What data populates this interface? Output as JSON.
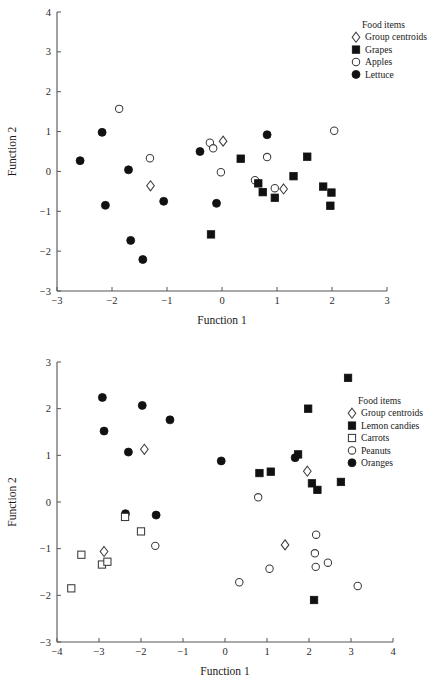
{
  "chart_data": [
    {
      "id": "top",
      "type": "scatter",
      "title": "",
      "xlabel": "Function 1",
      "ylabel": "Function 2",
      "xlim": [
        -3,
        3
      ],
      "ylim": [
        -3,
        4
      ],
      "xticks": [
        -3,
        -2,
        -1,
        0,
        1,
        2,
        3
      ],
      "xticklabels": [
        "−3",
        "−2",
        "−1",
        "0",
        "1",
        "2",
        "3"
      ],
      "yticks": [
        -3,
        -2,
        -1,
        0,
        1,
        2,
        3,
        4
      ],
      "yticklabels": [
        "−3",
        "−2",
        "−1",
        "0",
        "1",
        "2",
        "3",
        "4"
      ],
      "grid": false,
      "legend": {
        "title": "Food items",
        "position": "top-right",
        "entries": [
          {
            "label": "Group centroids",
            "marker": "diamond-open"
          },
          {
            "label": "Grapes",
            "marker": "square-filled"
          },
          {
            "label": "Apples",
            "marker": "circle-open"
          },
          {
            "label": "Lettuce",
            "marker": "circle-filled"
          }
        ]
      },
      "series": [
        {
          "name": "Lettuce",
          "marker": "circle-filled",
          "points": [
            [
              -2.58,
              0.27
            ],
            [
              -2.18,
              0.98
            ],
            [
              -2.12,
              -0.85
            ],
            [
              -1.7,
              0.04
            ],
            [
              -1.66,
              -1.73
            ],
            [
              -1.44,
              -2.21
            ],
            [
              -1.06,
              -0.75
            ],
            [
              -0.4,
              0.5
            ],
            [
              -0.1,
              -0.8
            ],
            [
              0.82,
              0.92
            ]
          ]
        },
        {
          "name": "Apples",
          "marker": "circle-open",
          "points": [
            [
              -1.87,
              1.57
            ],
            [
              -1.31,
              0.33
            ],
            [
              -0.22,
              0.72
            ],
            [
              -0.16,
              0.58
            ],
            [
              -0.02,
              -0.02
            ],
            [
              0.6,
              -0.22
            ],
            [
              0.82,
              0.36
            ],
            [
              0.96,
              -0.42
            ],
            [
              2.04,
              1.02
            ]
          ]
        },
        {
          "name": "Grapes",
          "marker": "square-filled",
          "points": [
            [
              -0.2,
              -1.58
            ],
            [
              0.34,
              0.32
            ],
            [
              0.66,
              -0.3
            ],
            [
              0.74,
              -0.52
            ],
            [
              0.96,
              -0.66
            ],
            [
              1.3,
              -0.12
            ],
            [
              1.55,
              0.37
            ],
            [
              1.84,
              -0.38
            ],
            [
              1.99,
              -0.53
            ],
            [
              1.97,
              -0.86
            ]
          ]
        },
        {
          "name": "Group centroids",
          "marker": "diamond-open",
          "points": [
            [
              -1.3,
              -0.36
            ],
            [
              0.02,
              0.76
            ],
            [
              1.12,
              -0.44
            ]
          ]
        }
      ]
    },
    {
      "id": "bottom",
      "type": "scatter",
      "title": "",
      "xlabel": "Function 1",
      "ylabel": "Function 2",
      "xlim": [
        -4,
        4
      ],
      "ylim": [
        -3,
        3
      ],
      "xticks": [
        -4,
        -3,
        -2,
        -1,
        0,
        1,
        2,
        3,
        4
      ],
      "xticklabels": [
        "−4",
        "−3",
        "−2",
        "−1",
        "0",
        "1",
        "2",
        "3",
        "4"
      ],
      "yticks": [
        -3,
        -2,
        -1,
        0,
        1,
        2,
        3
      ],
      "yticklabels": [
        "−3",
        "−2",
        "−1",
        "0",
        "1",
        "2",
        "3"
      ],
      "grid": false,
      "legend": {
        "title": "Food items",
        "position": "right",
        "entries": [
          {
            "label": "Group centroids",
            "marker": "diamond-open"
          },
          {
            "label": "Lemon candies",
            "marker": "square-filled"
          },
          {
            "label": "Carrots",
            "marker": "square-open"
          },
          {
            "label": "Peanuts",
            "marker": "circle-open"
          },
          {
            "label": "Oranges",
            "marker": "circle-filled"
          }
        ]
      },
      "series": [
        {
          "name": "Oranges",
          "marker": "circle-filled",
          "points": [
            [
              -2.92,
              2.24
            ],
            [
              -2.88,
              1.52
            ],
            [
              -2.3,
              1.07
            ],
            [
              -1.97,
              2.07
            ],
            [
              -1.64,
              -0.28
            ],
            [
              -1.31,
              1.76
            ],
            [
              -2.37,
              -0.25
            ],
            [
              -0.09,
              0.88
            ],
            [
              1.67,
              0.95
            ]
          ]
        },
        {
          "name": "Lemon candies",
          "marker": "square-filled",
          "points": [
            [
              2.93,
              2.66
            ],
            [
              1.98,
              2.0
            ],
            [
              0.82,
              0.62
            ],
            [
              1.09,
              0.65
            ],
            [
              1.74,
              1.02
            ],
            [
              2.07,
              0.4
            ],
            [
              2.2,
              0.26
            ],
            [
              2.76,
              0.43
            ],
            [
              2.12,
              -2.1
            ]
          ]
        },
        {
          "name": "Carrots",
          "marker": "square-open",
          "points": [
            [
              -3.66,
              -1.85
            ],
            [
              -3.42,
              -1.13
            ],
            [
              -2.93,
              -1.34
            ],
            [
              -2.8,
              -1.28
            ],
            [
              -2.38,
              -0.32
            ],
            [
              -2.0,
              -0.63
            ]
          ]
        },
        {
          "name": "Peanuts",
          "marker": "circle-open",
          "points": [
            [
              -1.66,
              -0.94
            ],
            [
              0.34,
              -1.72
            ],
            [
              0.79,
              0.1
            ],
            [
              1.06,
              -1.43
            ],
            [
              2.17,
              -0.7
            ],
            [
              2.14,
              -1.1
            ],
            [
              2.16,
              -1.39
            ],
            [
              2.45,
              -1.3
            ],
            [
              3.16,
              -1.8
            ]
          ]
        },
        {
          "name": "Group centroids",
          "marker": "diamond-open",
          "points": [
            [
              -1.92,
              1.13
            ],
            [
              -2.88,
              -1.06
            ],
            [
              1.43,
              -0.92
            ],
            [
              1.96,
              0.66
            ]
          ]
        }
      ]
    }
  ]
}
